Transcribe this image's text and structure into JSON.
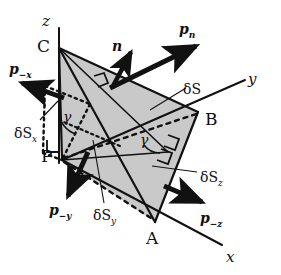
{
  "figure": {
    "background_color": "#ffffff",
    "ink_color": "#111111",
    "face_fill_color": "#c9c9c9"
  },
  "axes": [
    {
      "name": "z-axis",
      "label": "z",
      "x": 42,
      "y": 14
    },
    {
      "name": "y-axis",
      "label": "y",
      "x": 248,
      "y": 72
    },
    {
      "name": "x-axis",
      "label": "x",
      "x": 226,
      "y": 250
    }
  ],
  "vertices": [
    {
      "name": "vertex-C",
      "label": "C",
      "x": 37,
      "y": 38
    },
    {
      "name": "vertex-B",
      "label": "B",
      "x": 205,
      "y": 111
    },
    {
      "name": "vertex-A",
      "label": "A",
      "x": 146,
      "y": 230
    },
    {
      "name": "vertex-P",
      "label": "P",
      "x": 41,
      "y": 148
    }
  ],
  "vectors": [
    {
      "name": "normal-vector-n",
      "label": "n",
      "sub": "",
      "x": 112,
      "y": 39
    },
    {
      "name": "traction-vector-pn",
      "label": "p",
      "sub": "n",
      "x": 179,
      "y": 22
    },
    {
      "name": "traction-vector-p-minus-x",
      "label": "p",
      "sub": "−x",
      "x": 9,
      "y": 62
    },
    {
      "name": "traction-vector-p-minus-y",
      "label": "p",
      "sub": "−y",
      "x": 49,
      "y": 203
    },
    {
      "name": "traction-vector-p-minus-z",
      "label": "p",
      "sub": "−z",
      "x": 200,
      "y": 211
    }
  ],
  "areas": [
    {
      "name": "area-delta-S",
      "label": "δS",
      "sub": "",
      "x": 183,
      "y": 82
    },
    {
      "name": "area-delta-Sx",
      "label": "δS",
      "sub": "x",
      "x": 14,
      "y": 126
    },
    {
      "name": "area-delta-Sy",
      "label": "δS",
      "sub": "y",
      "x": 93,
      "y": 208
    },
    {
      "name": "area-delta-Sz",
      "label": "δS",
      "sub": "z",
      "x": 200,
      "y": 170
    }
  ],
  "angles": [
    {
      "name": "angle-gamma-left",
      "label": "γ",
      "x": 63,
      "y": 110
    },
    {
      "name": "angle-gamma-right",
      "label": "γ",
      "x": 140,
      "y": 133
    }
  ]
}
